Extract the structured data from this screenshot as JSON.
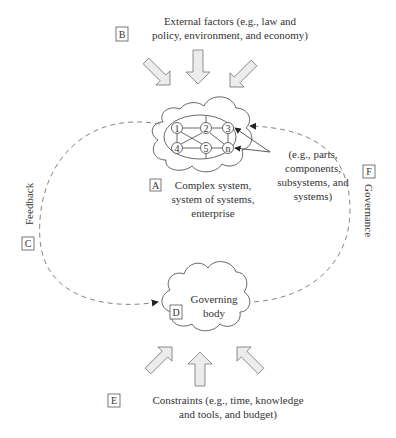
{
  "diagram": {
    "external_factors": {
      "letter": "B",
      "lines": [
        "External factors (e.g., law and",
        "policy, environment, and economy)"
      ]
    },
    "complex_system": {
      "letter": "A",
      "lines": [
        "Complex system,",
        "system of systems,",
        "enterprise"
      ]
    },
    "components_note": {
      "lines": [
        "(e.g., parts,",
        "components,",
        "subsystems, and",
        "systems)"
      ]
    },
    "nodes": [
      "1",
      "2",
      "3",
      "4",
      "5",
      "n"
    ],
    "feedback": {
      "letter": "C",
      "label": "Feedback"
    },
    "governance": {
      "letter": "F",
      "label": "Governance"
    },
    "governing_body": {
      "letter": "D",
      "lines": [
        "Governing",
        "body"
      ]
    },
    "constraints": {
      "letter": "E",
      "lines": [
        "Constraints (e.g., time, knowledge",
        "and tools, and budget)"
      ]
    }
  }
}
